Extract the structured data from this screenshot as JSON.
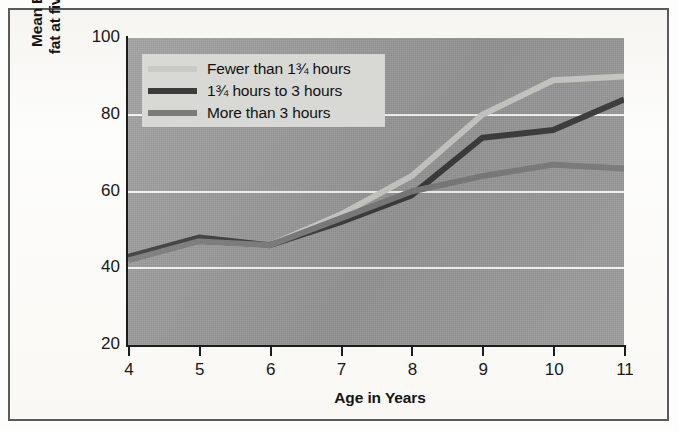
{
  "figure": {
    "background_color": "#fdfdfb",
    "border_color": "#5a5a5a",
    "plot_background_color": "#9a9a9a",
    "gridline_color": "#f4f4f2",
    "legend_background_color": "#d8d8d5"
  },
  "chart_data": {
    "type": "line",
    "title": "",
    "subtitle": "",
    "xlabel": "Age in Years",
    "ylabel": "Mean Body Fat Index (mm of fat at five body sites, summed)",
    "ylabel_line1": "Mean Body Fat Index (mm of",
    "ylabel_line2": "fat at five body sites, summed)",
    "x": [
      4,
      5,
      6,
      7,
      8,
      9,
      10,
      11
    ],
    "xtick_labels": [
      "4",
      "5",
      "6",
      "7",
      "8",
      "9",
      "10",
      "11"
    ],
    "ytick_labels": [
      "20",
      "40",
      "60",
      "80",
      "100"
    ],
    "yticks": [
      20,
      40,
      60,
      80,
      100
    ],
    "xlim": [
      4,
      11
    ],
    "ylim": [
      20,
      100
    ],
    "grid": "horizontal",
    "legend_position": "upper-left-inside",
    "series": [
      {
        "name": "Fewer than 1¾ hours",
        "color": "#c9c9c6",
        "values": [
          42,
          47,
          46,
          54,
          64,
          80,
          89,
          90
        ]
      },
      {
        "name": "1¾ hours to 3 hours",
        "color": "#3c3c3c",
        "values": [
          43,
          48,
          46,
          52,
          59,
          74,
          76,
          84
        ]
      },
      {
        "name": "More than 3 hours",
        "color": "#7b7b7b",
        "values": [
          42,
          47,
          46,
          53,
          60,
          64,
          67,
          66
        ]
      }
    ]
  },
  "legend": {
    "entries": [
      {
        "label": "Fewer than 1¾ hours",
        "color": "#c9c9c6"
      },
      {
        "label": "1¾ hours to 3 hours",
        "color": "#3c3c3c"
      },
      {
        "label": "More than 3 hours",
        "color": "#7b7b7b"
      }
    ]
  }
}
